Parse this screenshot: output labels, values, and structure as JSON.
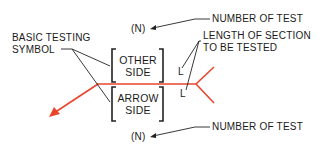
{
  "diagram": {
    "labels": {
      "basic_testing_symbol_line1": "BASIC TESTING",
      "basic_testing_symbol_line2": "SYMBOL",
      "number_top_marker": "(N)",
      "number_top_label": "NUMBER OF TEST",
      "length_label_line1": "LENGTH OF SECTION",
      "length_label_line2": "TO BE TESTED",
      "other_side_line1": "OTHER",
      "other_side_line2": "SIDE",
      "arrow_side_line1": "ARROW",
      "arrow_side_line2": "SIDE",
      "length_marker_other": "L",
      "length_marker_arrow": "L",
      "number_bottom_marker": "(N)",
      "number_bottom_label": "NUMBER OF TEST"
    },
    "colors": {
      "reference_line": "#e8452c",
      "leader_lines": "#222222",
      "text": "#1a1a1a"
    }
  }
}
